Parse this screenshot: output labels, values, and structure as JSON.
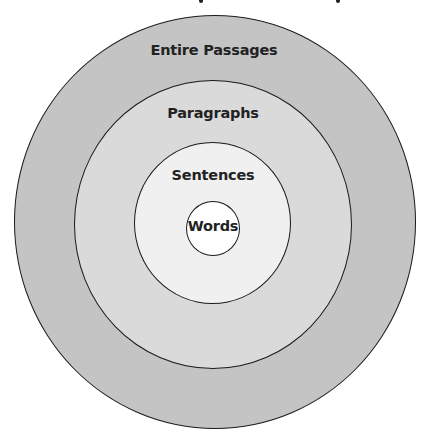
{
  "diagram": {
    "type": "concentric-circles",
    "levels": [
      {
        "label": "Entire Passages",
        "fill": "#c4c4c4"
      },
      {
        "label": "Paragraphs",
        "fill": "#dadada"
      },
      {
        "label": "Sentences",
        "fill": "#f0f0f0"
      },
      {
        "label": "Words",
        "fill": "#ffffff"
      }
    ],
    "outline_color": "#1a1a1a",
    "label_color": "#222222"
  }
}
